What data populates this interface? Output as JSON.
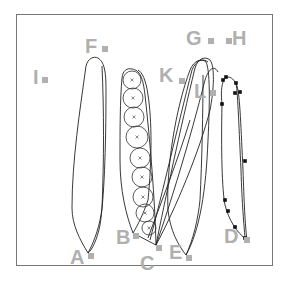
{
  "figure": {
    "frame": {
      "x": 16,
      "y": 14,
      "w": 257,
      "h": 252,
      "stroke": "#777777"
    },
    "label_color": "#b0b0b0",
    "labels": [
      {
        "id": "A",
        "text": "A",
        "x": 70,
        "y": 264,
        "sq_x": 88,
        "sq_y": 253
      },
      {
        "id": "B",
        "text": "B",
        "x": 116,
        "y": 244,
        "sq_x": 133,
        "sq_y": 233
      },
      {
        "id": "C",
        "text": "C",
        "x": 140,
        "y": 270,
        "sq_x": 156,
        "sq_y": 245
      },
      {
        "id": "D",
        "text": "D",
        "x": 224,
        "y": 243,
        "sq_x": 244,
        "sq_y": 237
      },
      {
        "id": "E",
        "text": "E",
        "x": 169,
        "y": 259,
        "sq_x": 186,
        "sq_y": 255
      },
      {
        "id": "F",
        "text": "F",
        "x": 85,
        "y": 53,
        "sq_x": 102,
        "sq_y": 46
      },
      {
        "id": "G",
        "text": "G",
        "x": 186,
        "y": 45,
        "sq_x": 208,
        "sq_y": 38
      },
      {
        "id": "H",
        "text": "H",
        "x": 232,
        "y": 45,
        "sq_x": 226,
        "sq_y": 38
      },
      {
        "id": "I",
        "text": "I",
        "x": 33,
        "y": 84,
        "sq_x": 42,
        "sq_y": 77
      },
      {
        "id": "K",
        "text": "K",
        "x": 159,
        "y": 82,
        "sq_x": 179,
        "sq_y": 78
      },
      {
        "id": "L",
        "text": "L",
        "x": 194,
        "y": 98,
        "sq_x": 210,
        "sq_y": 90
      }
    ],
    "circles_stack": [
      {
        "cx": 132,
        "cy": 80,
        "r": 9
      },
      {
        "cx": 133,
        "cy": 98,
        "r": 10
      },
      {
        "cx": 134,
        "cy": 117,
        "r": 10
      },
      {
        "cx": 137,
        "cy": 137,
        "r": 11
      },
      {
        "cx": 140,
        "cy": 158,
        "r": 10
      },
      {
        "cx": 142,
        "cy": 177,
        "r": 10
      },
      {
        "cx": 143,
        "cy": 197,
        "r": 10
      },
      {
        "cx": 145,
        "cy": 213,
        "r": 9
      },
      {
        "cx": 149,
        "cy": 228,
        "r": 7
      }
    ],
    "dots": [
      {
        "x": 223,
        "y": 80
      },
      {
        "x": 226,
        "y": 77
      },
      {
        "x": 236,
        "y": 83
      },
      {
        "x": 240,
        "y": 92
      },
      {
        "x": 235,
        "y": 93
      },
      {
        "x": 222,
        "y": 104
      },
      {
        "x": 245,
        "y": 161
      },
      {
        "x": 225,
        "y": 200
      },
      {
        "x": 228,
        "y": 211
      },
      {
        "x": 235,
        "y": 227
      },
      {
        "x": 245,
        "y": 238
      },
      {
        "x": 247,
        "y": 240
      }
    ]
  }
}
